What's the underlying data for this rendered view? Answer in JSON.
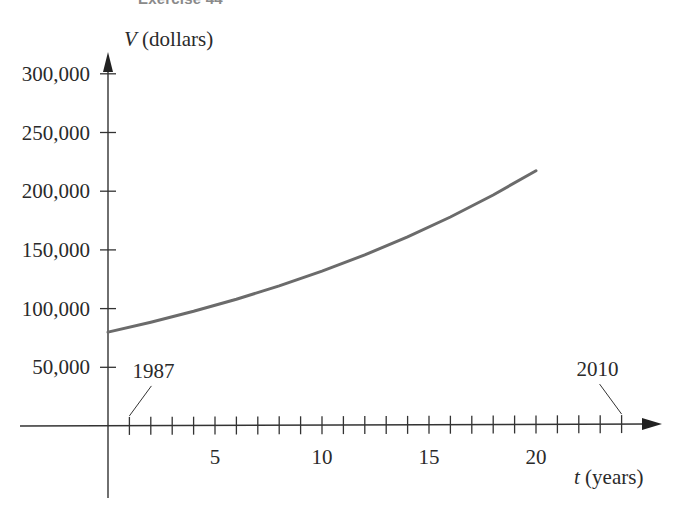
{
  "figure": {
    "caption": "Exercise 44"
  },
  "chart_data": {
    "type": "line",
    "title": "Exercise 44",
    "xlabel": "t (years)",
    "ylabel": "V (dollars)",
    "x_var": "t",
    "y_var": "V",
    "x_unit": "(years)",
    "y_unit": "(dollars)",
    "xlim": [
      0,
      25
    ],
    "ylim": [
      0,
      320000
    ],
    "x_ticks": [
      1,
      2,
      3,
      4,
      5,
      6,
      7,
      8,
      9,
      10,
      11,
      12,
      13,
      14,
      15,
      16,
      17,
      18,
      19,
      20,
      21,
      22,
      23,
      24
    ],
    "x_tick_labels": [
      "5",
      "10",
      "15",
      "20"
    ],
    "x_tick_label_values": [
      5,
      10,
      15,
      20
    ],
    "y_ticks": [
      50000,
      100000,
      150000,
      200000,
      250000,
      300000
    ],
    "y_tick_labels": [
      "50,000",
      "100,000",
      "150,000",
      "200,000",
      "250,000",
      "300,000"
    ],
    "annotations": [
      {
        "text": "1987",
        "t": 1
      },
      {
        "text": "2010",
        "t": 24
      }
    ],
    "grid": false,
    "legend": null,
    "series": [
      {
        "name": "V(t)",
        "x": [
          0,
          2,
          4,
          6,
          8,
          10,
          12,
          14,
          16,
          18,
          20
        ],
        "values": [
          80000,
          88400,
          97700,
          108000,
          119300,
          131900,
          145700,
          161100,
          178000,
          196800,
          217500
        ],
        "color": "#6b6b6b"
      }
    ]
  }
}
